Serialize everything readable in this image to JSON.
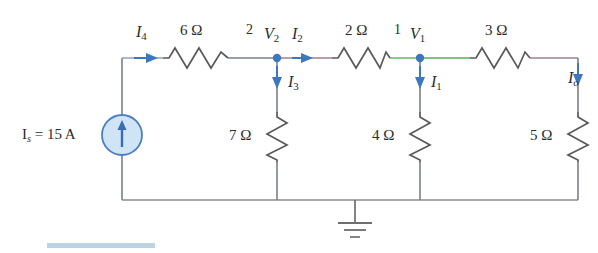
{
  "figure": {
    "type": "electrical-circuit-schematic",
    "width": 598,
    "height": 253
  },
  "source": {
    "name": "independent-current-source",
    "label_prefix": "I",
    "label_sub": "s",
    "label_text": "I",
    "full_label": "I_s = 15 A",
    "equals": "=",
    "value": "15 A",
    "direction": "up",
    "color": "#4a7fc1",
    "fill": "#cfe4f5"
  },
  "nodes": [
    {
      "name": "node-2",
      "number": "2",
      "voltage_symbol": "V",
      "voltage_sub": "2"
    },
    {
      "name": "node-1",
      "number": "1",
      "voltage_symbol": "V",
      "voltage_sub": "1"
    }
  ],
  "resistors": [
    {
      "name": "r-6ohm",
      "value": "6",
      "unit": "Ω",
      "label": "6 Ω",
      "orientation": "horizontal"
    },
    {
      "name": "r-2ohm",
      "value": "2",
      "unit": "Ω",
      "label": "2 Ω",
      "orientation": "horizontal"
    },
    {
      "name": "r-3ohm",
      "value": "3",
      "unit": "Ω",
      "label": "3 Ω",
      "orientation": "horizontal"
    },
    {
      "name": "r-7ohm",
      "value": "7",
      "unit": "Ω",
      "label": "7 Ω",
      "orientation": "vertical"
    },
    {
      "name": "r-4ohm",
      "value": "4",
      "unit": "Ω",
      "label": "4 Ω",
      "orientation": "vertical"
    },
    {
      "name": "r-5ohm",
      "value": "5",
      "unit": "Ω",
      "label": "5 Ω",
      "orientation": "vertical"
    }
  ],
  "currents": [
    {
      "name": "current-i4",
      "symbol": "I",
      "sub": "4",
      "direction": "right",
      "branch": "6-ohm-input"
    },
    {
      "name": "current-i2",
      "symbol": "I",
      "sub": "2",
      "direction": "right",
      "branch": "2-ohm"
    },
    {
      "name": "current-i3",
      "symbol": "I",
      "sub": "3",
      "direction": "down",
      "branch": "7-ohm"
    },
    {
      "name": "current-i1",
      "symbol": "I",
      "sub": "1",
      "direction": "down",
      "branch": "4-ohm"
    },
    {
      "name": "current-io",
      "symbol": "I",
      "sub": "o",
      "direction": "down",
      "branch": "5-ohm"
    }
  ],
  "ground": {
    "name": "ground-symbol",
    "type": "earth-ground",
    "bars": 3
  },
  "colors": {
    "wire": "#6b6b6b",
    "arrow": "#3d77bd",
    "node_dot": "#3d77bd",
    "tint_green": "#7fc47f",
    "tint_mauve": "#9f7f99",
    "tint_blue": "#8f9fc0",
    "text": "#2b2b2b",
    "accent_bar": "#bcd3e6"
  }
}
